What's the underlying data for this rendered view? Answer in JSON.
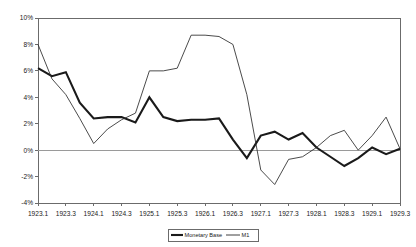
{
  "chart_data": {
    "type": "line",
    "title": "",
    "xlabel": "",
    "ylabel": "",
    "ylim": [
      -4,
      10
    ],
    "y_ticks": [
      "-4%",
      "-2%",
      "0%",
      "2%",
      "4%",
      "6%",
      "8%",
      "10%"
    ],
    "y_tick_values": [
      -4,
      -2,
      0,
      2,
      4,
      6,
      8,
      10
    ],
    "grid": false,
    "legend_position": "bottom-center",
    "x": [
      "1923.1",
      "1923.2",
      "1923.3",
      "1923.4",
      "1924.1",
      "1924.2",
      "1924.3",
      "1924.4",
      "1925.1",
      "1925.2",
      "1925.3",
      "1925.4",
      "1926.1",
      "1926.2",
      "1926.3",
      "1926.4",
      "1927.1",
      "1927.2",
      "1927.3",
      "1927.4",
      "1928.1",
      "1928.2",
      "1928.3",
      "1928.4",
      "1929.1",
      "1929.2",
      "1929.3"
    ],
    "x_tick_labels": [
      "1923.1",
      "1923.3",
      "1924.1",
      "1924.3",
      "1925.1",
      "1925.3",
      "1926.1",
      "1926.3",
      "1927.1",
      "1927.3",
      "1928.1",
      "1928.3",
      "1929.1",
      "1929.3"
    ],
    "x_tick_indices": [
      0,
      2,
      4,
      6,
      8,
      10,
      12,
      14,
      16,
      18,
      20,
      22,
      24,
      26
    ],
    "series": [
      {
        "name": "Monetary Base",
        "color": "#1a1a1a",
        "width": "thick",
        "values": [
          6.2,
          5.6,
          5.9,
          3.6,
          2.4,
          2.5,
          2.5,
          2.1,
          4.0,
          2.5,
          2.2,
          2.3,
          2.3,
          2.4,
          0.8,
          -0.6,
          1.1,
          1.4,
          0.8,
          1.3,
          0.2,
          -0.5,
          -1.2,
          -0.6,
          0.2,
          -0.3,
          0.1
        ]
      },
      {
        "name": "M1",
        "color": "#2b2b2b",
        "width": "thin",
        "values": [
          8.0,
          5.4,
          4.2,
          2.4,
          0.5,
          1.6,
          2.3,
          2.8,
          6.0,
          6.0,
          6.2,
          8.7,
          8.7,
          8.6,
          8.0,
          4.2,
          -1.5,
          -2.6,
          -0.7,
          -0.5,
          0.2,
          1.1,
          1.5,
          0.0,
          1.1,
          2.5,
          0.1
        ]
      }
    ],
    "legend": [
      {
        "label": "Monetary Base",
        "style": "thick"
      },
      {
        "label": "M1",
        "style": "thin"
      }
    ]
  },
  "legend": {
    "monetary_base_label": "Monetary Base",
    "m1_label": "M1"
  }
}
